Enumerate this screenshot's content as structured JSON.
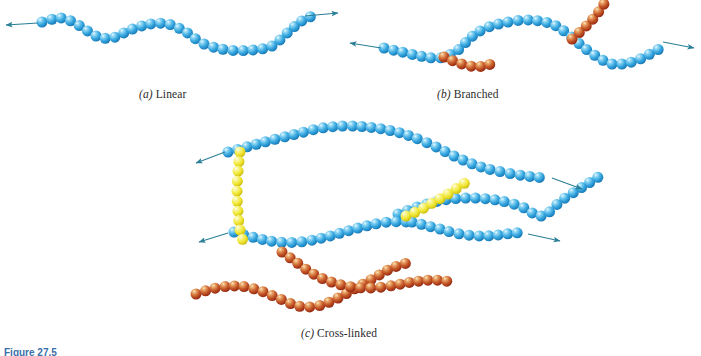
{
  "figure": {
    "number_label": "Figure 27.5",
    "background_color": "#ffffff",
    "panels": [
      {
        "id": "a",
        "label": "(a)",
        "name": "Linear",
        "caption": "(a)  Linear"
      },
      {
        "id": "b",
        "label": "(b)",
        "name": "Branched",
        "caption": "(b)  Branched"
      },
      {
        "id": "c",
        "label": "(c)",
        "name": "Cross-linked",
        "caption": "(c)  Cross-linked"
      }
    ],
    "colors": {
      "main_chain_blue": "#3aa9e0",
      "main_chain_blue_dark": "#1b7fbd",
      "main_chain_highlight": "#cdeefb",
      "branch_red": "#c0391d",
      "branch_red_dark": "#8e2410",
      "branch_red_highlight": "#f0c08a",
      "crosslink_yellow": "#f2ea3c",
      "crosslink_yellow_dark": "#ccc017",
      "crosslink_yellow_highlight": "#fdfbc4",
      "arrow": "#2a7f96",
      "caption_text": "#2b2b2b",
      "figure_number": "#3a6ea8"
    },
    "sphere_diameter_px": 11
  },
  "chart_data": {
    "type": "diagram",
    "subtitle": "Schematic representations of (a) linear, (b) branched, and (c) cross-linked polymer molecules",
    "legend": [
      {
        "color": "#3aa9e0",
        "label": "Main chain mer unit (blue sphere)"
      },
      {
        "color": "#c0391d",
        "label": "Side-branch / secondary chain mer unit (red sphere)"
      },
      {
        "color": "#f2ea3c",
        "label": "Cross-link mer unit (yellow sphere)"
      }
    ],
    "panels": [
      {
        "id": "a",
        "caption": "(a)  Linear",
        "chains": 1,
        "blue_spheres": 42,
        "red_spheres": 0,
        "yellow_spheres": 0,
        "arrows": 2,
        "description": "A single continuous wavy chain of blue mer units with continuation arrows at both ends."
      },
      {
        "id": "b",
        "caption": "(b)  Branched",
        "chains": 1,
        "blue_spheres": 42,
        "red_spheres": 11,
        "yellow_spheres": 0,
        "arrows": 2,
        "branches": 2,
        "description": "A main blue chain with two short red side-branch chains attached at junction points."
      },
      {
        "id": "c",
        "caption": "(c)  Cross-linked",
        "chains": 4,
        "blue_spheres": 96,
        "red_spheres": 42,
        "yellow_spheres": 17,
        "arrows": 4,
        "crosslinks": 2,
        "description": "Two blue chains joined by yellow cross-link chains, plus two crossing red chains below."
      }
    ]
  }
}
